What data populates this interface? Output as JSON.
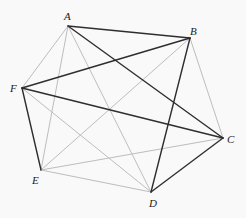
{
  "diagram": {
    "type": "complete-graph-K6",
    "colors": {
      "background": "#f9f9f9",
      "dark_edge": "#2e2e2e",
      "light_edge": "#bdbdbd",
      "label": "#222222"
    },
    "vertices": [
      {
        "id": "A",
        "x": 68,
        "y": 26,
        "label": "A",
        "lx": 64,
        "ly": 20
      },
      {
        "id": "B",
        "x": 190,
        "y": 38,
        "label": "B",
        "lx": 190,
        "ly": 35
      },
      {
        "id": "C",
        "x": 223,
        "y": 138,
        "label": "C",
        "lx": 227,
        "ly": 143
      },
      {
        "id": "D",
        "x": 151,
        "y": 192,
        "label": "D",
        "lx": 149,
        "ly": 207
      },
      {
        "id": "E",
        "x": 41,
        "y": 170,
        "label": "E",
        "lx": 32,
        "ly": 184
      },
      {
        "id": "F",
        "x": 22,
        "y": 88,
        "label": "F",
        "lx": 10,
        "ly": 92
      }
    ],
    "dark_edges": [
      [
        "A",
        "B"
      ],
      [
        "A",
        "C"
      ],
      [
        "F",
        "B"
      ],
      [
        "F",
        "C"
      ],
      [
        "F",
        "E"
      ],
      [
        "B",
        "D"
      ],
      [
        "C",
        "D"
      ]
    ],
    "light_edges": [
      [
        "A",
        "F"
      ],
      [
        "A",
        "E"
      ],
      [
        "A",
        "D"
      ],
      [
        "B",
        "E"
      ],
      [
        "B",
        "C"
      ],
      [
        "E",
        "D"
      ],
      [
        "E",
        "C"
      ],
      [
        "F",
        "D"
      ]
    ]
  }
}
